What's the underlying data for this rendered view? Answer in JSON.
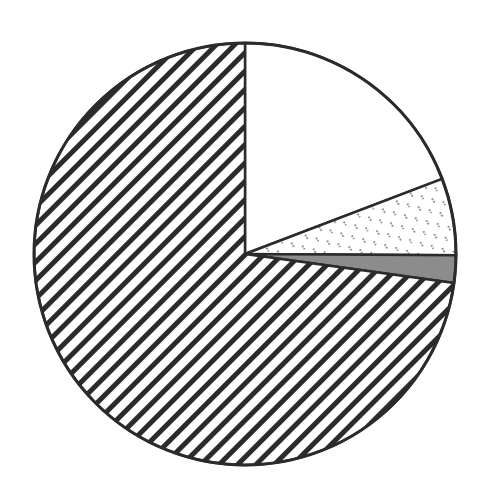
{
  "chart_data": {
    "type": "pie",
    "title": "",
    "legend": [],
    "start_angle_deg": 90,
    "direction": "clockwise",
    "slices": [
      {
        "label": "",
        "value": 19.2,
        "fill": "white",
        "color": "#ffffff"
      },
      {
        "label": "",
        "value": 5.9,
        "fill": "dotted-dash",
        "color": "#ffffff"
      },
      {
        "label": "",
        "value": 2.1,
        "fill": "solid-grey",
        "color": "#8c8c8c"
      },
      {
        "label": "",
        "value": 72.8,
        "fill": "diagonal-hatch",
        "color": "#2b2b2b"
      }
    ],
    "center": [
      245,
      254
    ],
    "radius": 211,
    "stroke_color": "#2b2b2b"
  }
}
